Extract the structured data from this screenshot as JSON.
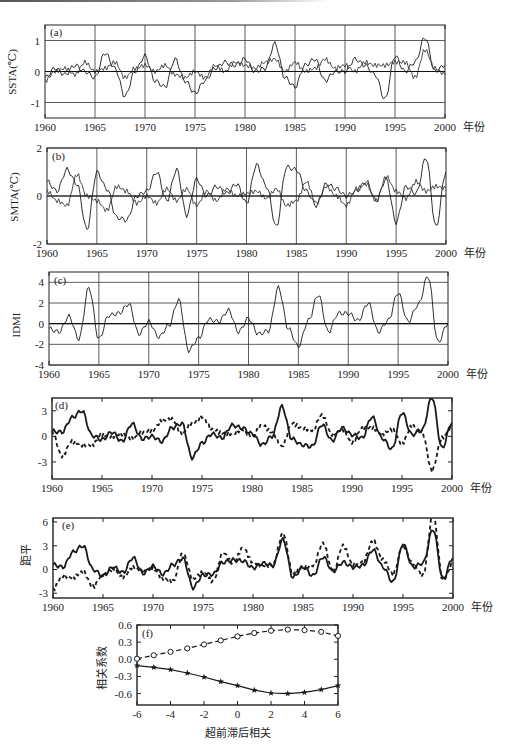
{
  "figure": {
    "year_suffix": "年份",
    "x_ticks": [
      "1960",
      "1965",
      "1970",
      "1975",
      "1980",
      "1985",
      "1990",
      "1995",
      "2000"
    ]
  },
  "chart_data": [
    {
      "id": "a",
      "type": "line",
      "panel_label": "(a)",
      "title": "",
      "xlabel": "年份",
      "ylabel": "SSTA(℃)",
      "xlim": [
        1960,
        2000
      ],
      "ylim": [
        -1.5,
        1.5
      ],
      "y_ticks": [
        "1",
        "0",
        "-1"
      ],
      "y_tick_values": [
        1,
        0,
        -1
      ],
      "grid": true,
      "series": [
        {
          "name": "series 1 (solid thin)",
          "style": "solid",
          "x": [
            1960,
            1961,
            1962,
            1963,
            1964,
            1965,
            1966,
            1967,
            1968,
            1969,
            1970,
            1971,
            1972,
            1973,
            1974,
            1975,
            1976,
            1977,
            1978,
            1979,
            1980,
            1981,
            1982,
            1983,
            1984,
            1985,
            1986,
            1987,
            1988,
            1989,
            1990,
            1991,
            1992,
            1993,
            1994,
            1995,
            1996,
            1997,
            1998,
            1999,
            2000
          ],
          "values": [
            -0.2,
            0.1,
            -0.1,
            0.2,
            0.0,
            -0.2,
            0.6,
            0.1,
            -0.8,
            0.0,
            0.5,
            -0.3,
            -0.5,
            0.4,
            -0.3,
            -0.7,
            -0.3,
            0.1,
            0.3,
            0.2,
            0.4,
            0.0,
            0.1,
            0.9,
            -0.2,
            -0.5,
            0.2,
            0.4,
            -0.3,
            0.0,
            0.0,
            0.4,
            0.2,
            -0.1,
            -0.9,
            0.5,
            0.0,
            0.3,
            1.1,
            0.0,
            0.2
          ]
        },
        {
          "name": "series 2 (solid thin)",
          "style": "solid",
          "x": [
            1960,
            1961,
            1962,
            1963,
            1964,
            1965,
            1966,
            1967,
            1968,
            1969,
            1970,
            1971,
            1972,
            1973,
            1974,
            1975,
            1976,
            1977,
            1978,
            1979,
            1980,
            1981,
            1982,
            1983,
            1984,
            1985,
            1986,
            1987,
            1988,
            1989,
            1990,
            1991,
            1992,
            1993,
            1994,
            1995,
            1996,
            1997,
            1998,
            1999,
            2000
          ],
          "values": [
            -0.3,
            0.0,
            0.1,
            -0.1,
            0.3,
            0.0,
            0.1,
            0.3,
            -0.2,
            0.1,
            0.2,
            0.0,
            0.2,
            -0.1,
            -0.2,
            0.0,
            -0.2,
            0.2,
            0.0,
            0.3,
            0.2,
            0.1,
            0.3,
            0.4,
            0.0,
            0.3,
            0.0,
            0.1,
            0.4,
            0.1,
            0.2,
            0.0,
            0.3,
            0.2,
            0.2,
            0.3,
            0.3,
            -0.2,
            0.7,
            0.1,
            -0.1
          ]
        }
      ]
    },
    {
      "id": "b",
      "type": "line",
      "panel_label": "(b)",
      "title": "",
      "xlabel": "年份",
      "ylabel": "SMTA(℃)",
      "xlim": [
        1960,
        2000
      ],
      "ylim": [
        -2,
        2
      ],
      "y_ticks": [
        "2",
        "0",
        "-2"
      ],
      "y_tick_values": [
        2,
        0,
        -2
      ],
      "grid": true,
      "series": [
        {
          "name": "series 1 (solid thin)",
          "style": "solid",
          "x": [
            1960,
            1961,
            1962,
            1963,
            1964,
            1965,
            1966,
            1967,
            1968,
            1969,
            1970,
            1971,
            1972,
            1973,
            1974,
            1975,
            1976,
            1977,
            1978,
            1979,
            1980,
            1981,
            1982,
            1983,
            1984,
            1985,
            1986,
            1987,
            1988,
            1989,
            1990,
            1991,
            1992,
            1993,
            1994,
            1995,
            1996,
            1997,
            1998,
            1999,
            2000
          ],
          "values": [
            0.6,
            0.2,
            1.1,
            0.5,
            -1.4,
            1.0,
            0.3,
            -0.9,
            -1.0,
            0.0,
            0.2,
            1.0,
            -0.2,
            1.1,
            -0.8,
            0.7,
            0.0,
            0.4,
            0.1,
            0.5,
            -0.3,
            1.3,
            0.4,
            -1.3,
            1.2,
            1.1,
            0.2,
            -0.4,
            0.5,
            0.3,
            0.0,
            0.2,
            0.6,
            -0.2,
            0.7,
            -1.1,
            0.4,
            0.1,
            1.6,
            -1.3,
            1.0
          ]
        },
        {
          "name": "series 2 (solid thin)",
          "style": "solid",
          "x": [
            1960,
            1961,
            1962,
            1963,
            1964,
            1965,
            1966,
            1967,
            1968,
            1969,
            1970,
            1971,
            1972,
            1973,
            1974,
            1975,
            1976,
            1977,
            1978,
            1979,
            1980,
            1981,
            1982,
            1983,
            1984,
            1985,
            1986,
            1987,
            1988,
            1989,
            1990,
            1991,
            1992,
            1993,
            1994,
            1995,
            1996,
            1997,
            1998,
            1999,
            2000
          ],
          "values": [
            0.2,
            -0.2,
            -0.4,
            0.9,
            0.0,
            -0.2,
            -0.6,
            0.4,
            0.2,
            -0.3,
            0.0,
            -0.3,
            0.3,
            -0.2,
            0.3,
            -0.4,
            0.2,
            -0.2,
            0.3,
            0.0,
            0.1,
            0.2,
            -0.1,
            0.3,
            -0.4,
            -0.2,
            0.6,
            -0.3,
            0.4,
            0.0,
            -0.4,
            0.3,
            0.5,
            -0.2,
            0.8,
            0.2,
            -0.1,
            0.6,
            0.2,
            0.4,
            0.3
          ]
        }
      ]
    },
    {
      "id": "c",
      "type": "line",
      "panel_label": "(c)",
      "title": "",
      "xlabel": "年份",
      "ylabel": "IDMI",
      "xlim": [
        1960,
        2000
      ],
      "ylim": [
        -4,
        5
      ],
      "y_ticks": [
        "4",
        "2",
        "0",
        "-2",
        "-4"
      ],
      "y_tick_values": [
        4,
        2,
        0,
        -2,
        -4
      ],
      "grid": true,
      "series": [
        {
          "name": "IDMI",
          "style": "solid",
          "x": [
            1960,
            1961,
            1962,
            1963,
            1964,
            1965,
            1966,
            1967,
            1968,
            1969,
            1970,
            1971,
            1972,
            1973,
            1974,
            1975,
            1976,
            1977,
            1978,
            1979,
            1980,
            1981,
            1982,
            1983,
            1984,
            1985,
            1986,
            1987,
            1988,
            1989,
            1990,
            1991,
            1992,
            1993,
            1994,
            1995,
            1996,
            1997,
            1998,
            1999,
            2000
          ],
          "values": [
            -0.5,
            -0.8,
            0.7,
            -1.5,
            3.5,
            -1.5,
            0.8,
            1.0,
            1.9,
            -1.0,
            0.2,
            -1.3,
            -0.2,
            2.3,
            -2.6,
            -1.4,
            0.4,
            0.2,
            1.3,
            -0.8,
            0.5,
            -1.0,
            -0.7,
            3.5,
            -0.5,
            -2.2,
            0.3,
            2.8,
            -0.8,
            1.0,
            1.0,
            0.3,
            2.0,
            -0.8,
            0.3,
            3.0,
            0.2,
            1.8,
            4.6,
            -1.8,
            0.0
          ]
        }
      ]
    },
    {
      "id": "d",
      "type": "line",
      "panel_label": "(d)",
      "title": "",
      "xlabel": "年份",
      "ylabel": "",
      "xlim": [
        1960,
        2000
      ],
      "ylim": [
        -5,
        4.5
      ],
      "y_ticks": [
        "3",
        "0",
        "-3"
      ],
      "y_tick_values": [
        3,
        0,
        -3
      ],
      "grid": false,
      "series": [
        {
          "name": "solid (thick)",
          "style": "solid",
          "x": [
            1960,
            1961,
            1962,
            1963,
            1964,
            1965,
            1966,
            1967,
            1968,
            1969,
            1970,
            1971,
            1972,
            1973,
            1974,
            1975,
            1976,
            1977,
            1978,
            1979,
            1980,
            1981,
            1982,
            1983,
            1984,
            1985,
            1986,
            1987,
            1988,
            1989,
            1990,
            1991,
            1992,
            1993,
            1994,
            1995,
            1996,
            1997,
            1998,
            1999,
            2000
          ],
          "values": [
            0.6,
            0.5,
            2.2,
            3.0,
            0.1,
            -0.4,
            0.5,
            -0.6,
            1.5,
            -0.3,
            0.0,
            -0.6,
            1.0,
            1.5,
            -2.5,
            -0.8,
            0.3,
            -0.2,
            1.3,
            1.0,
            0.3,
            -1.0,
            0.0,
            3.5,
            -0.3,
            -1.0,
            -1.2,
            1.4,
            -0.5,
            1.0,
            0.2,
            -0.2,
            2.3,
            -0.2,
            -1.5,
            2.8,
            0.2,
            0.7,
            4.6,
            -1.4,
            1.6
          ]
        },
        {
          "name": "dashed",
          "style": "dashed",
          "x": [
            1960,
            1961,
            1962,
            1963,
            1964,
            1965,
            1966,
            1967,
            1968,
            1969,
            1970,
            1971,
            1972,
            1973,
            1974,
            1975,
            1976,
            1977,
            1978,
            1979,
            1980,
            1981,
            1982,
            1983,
            1984,
            1985,
            1986,
            1987,
            1988,
            1989,
            1990,
            1991,
            1992,
            1993,
            1994,
            1995,
            1996,
            1997,
            1998,
            1999,
            2000
          ],
          "values": [
            0.5,
            -2.3,
            -0.6,
            -1.0,
            -1.0,
            0.2,
            0.0,
            0.3,
            -0.3,
            0.4,
            0.7,
            1.8,
            2.0,
            0.3,
            1.5,
            2.3,
            0.8,
            0.4,
            0.3,
            0.8,
            0.0,
            1.3,
            0.5,
            -1.2,
            1.5,
            1.0,
            0.7,
            2.5,
            0.2,
            0.8,
            -0.7,
            0.9,
            1.0,
            0.3,
            0.8,
            -0.8,
            1.2,
            0.5,
            -4.0,
            -0.2,
            1.0
          ]
        }
      ]
    },
    {
      "id": "e",
      "type": "line",
      "panel_label": "(e)",
      "title": "",
      "xlabel": "年份",
      "ylabel": "距平",
      "xlim": [
        1960,
        2000
      ],
      "ylim": [
        -3.6,
        6.5
      ],
      "y_ticks": [
        "6",
        "3",
        "0",
        "-3"
      ],
      "y_tick_values": [
        6,
        3,
        0,
        -3
      ],
      "grid": false,
      "series": [
        {
          "name": "solid (thick)",
          "style": "solid",
          "x": [
            1960,
            1961,
            1962,
            1963,
            1964,
            1965,
            1966,
            1967,
            1968,
            1969,
            1970,
            1971,
            1972,
            1973,
            1974,
            1975,
            1976,
            1977,
            1978,
            1979,
            1980,
            1981,
            1982,
            1983,
            1984,
            1985,
            1986,
            1987,
            1988,
            1989,
            1990,
            1991,
            1992,
            1993,
            1994,
            1995,
            1996,
            1997,
            1998,
            1999,
            2000
          ],
          "values": [
            0.6,
            0.3,
            2.2,
            3.0,
            0.0,
            -0.8,
            0.3,
            -0.4,
            1.5,
            -0.5,
            0.4,
            -0.6,
            0.6,
            1.4,
            -2.3,
            -0.7,
            -0.6,
            0.9,
            1.2,
            1.1,
            0.2,
            0.8,
            0.5,
            3.8,
            -1.0,
            0.3,
            -0.8,
            1.6,
            -0.2,
            0.9,
            0.3,
            0.5,
            2.5,
            0.3,
            -1.6,
            3.2,
            0.3,
            0.8,
            5.1,
            -1.2,
            1.5
          ]
        },
        {
          "name": "dashed",
          "style": "dashed",
          "x": [
            1960,
            1961,
            1962,
            1963,
            1964,
            1965,
            1966,
            1967,
            1968,
            1969,
            1970,
            1971,
            1972,
            1973,
            1974,
            1975,
            1976,
            1977,
            1978,
            1979,
            1980,
            1981,
            1982,
            1983,
            1984,
            1985,
            1986,
            1987,
            1988,
            1989,
            1990,
            1991,
            1992,
            1993,
            1994,
            1995,
            1996,
            1997,
            1998,
            1999,
            2000
          ],
          "values": [
            -2.5,
            -0.8,
            -1.0,
            -0.3,
            -2.2,
            -0.6,
            0.0,
            -1.0,
            0.3,
            -0.3,
            0.1,
            -1.1,
            -1.5,
            2.0,
            -1.2,
            -0.4,
            -1.5,
            2.1,
            0.8,
            2.7,
            0.9,
            0.5,
            0.6,
            4.6,
            -0.6,
            0.3,
            0.5,
            3.3,
            -0.3,
            3.0,
            0.6,
            1.0,
            3.6,
            1.2,
            -0.6,
            3.0,
            0.7,
            -0.8,
            7.0,
            -1.4,
            0.7
          ]
        }
      ]
    },
    {
      "id": "f",
      "type": "line",
      "panel_label": "(f)",
      "title": "",
      "xlabel": "超前滞后相关",
      "ylabel": "相关系数",
      "xlim": [
        -6,
        6
      ],
      "ylim": [
        -0.8,
        0.6
      ],
      "x_ticks": [
        "-6",
        "-4",
        "-2",
        "0",
        "2",
        "4",
        "6"
      ],
      "x_tick_values": [
        -6,
        -4,
        -2,
        0,
        2,
        4,
        6
      ],
      "y_ticks": [
        "0.6",
        "0.3",
        "0.0",
        "-0.3",
        "-0.6"
      ],
      "y_tick_values": [
        0.6,
        0.3,
        0.0,
        -0.3,
        -0.6
      ],
      "grid": false,
      "series": [
        {
          "name": "dashed with circles",
          "style": "dashed",
          "marker": "circle",
          "x": [
            -6,
            -5,
            -4,
            -3,
            -2,
            -1,
            0,
            1,
            2,
            3,
            4,
            5,
            6
          ],
          "values": [
            0.01,
            0.07,
            0.13,
            0.19,
            0.26,
            0.33,
            0.4,
            0.46,
            0.5,
            0.52,
            0.51,
            0.48,
            0.41
          ]
        },
        {
          "name": "solid with stars",
          "style": "solid",
          "marker": "star",
          "x": [
            -6,
            -5,
            -4,
            -3,
            -2,
            -1,
            0,
            1,
            2,
            3,
            4,
            5,
            6
          ],
          "values": [
            -0.11,
            -0.14,
            -0.18,
            -0.24,
            -0.31,
            -0.39,
            -0.46,
            -0.54,
            -0.59,
            -0.6,
            -0.58,
            -0.53,
            -0.46
          ]
        }
      ]
    }
  ]
}
